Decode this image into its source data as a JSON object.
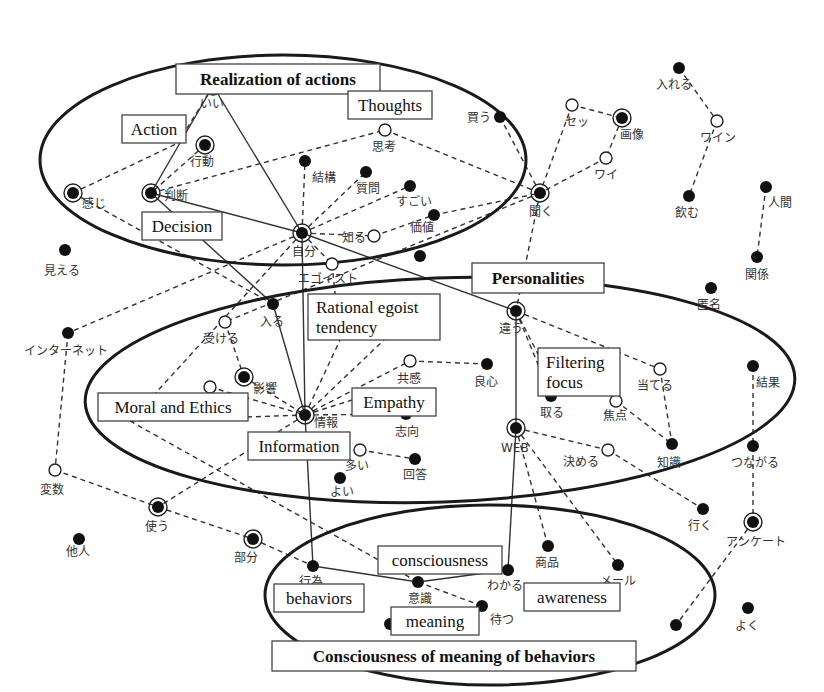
{
  "ellipses": [
    {
      "id": "realization",
      "cx": 283,
      "cy": 160,
      "rx": 243,
      "ry": 105,
      "rot": 0
    },
    {
      "id": "personalities",
      "cx": 440,
      "cy": 390,
      "rx": 355,
      "ry": 112,
      "rot": -2
    },
    {
      "id": "consciousness",
      "cx": 490,
      "cy": 595,
      "rx": 225,
      "ry": 90,
      "rot": 0
    }
  ],
  "categories": [
    {
      "id": "realization",
      "label": "Realization of actions",
      "x": 176,
      "y": 64,
      "w": 204,
      "h": 30,
      "bold": true
    },
    {
      "id": "action",
      "label": "Action",
      "x": 122,
      "y": 115,
      "w": 64,
      "h": 28,
      "bold": false
    },
    {
      "id": "thoughts",
      "label": "Thoughts",
      "x": 348,
      "y": 91,
      "w": 84,
      "h": 28,
      "bold": false
    },
    {
      "id": "decision",
      "label": "Decision",
      "x": 142,
      "y": 212,
      "w": 80,
      "h": 28,
      "bold": false
    },
    {
      "id": "personalities",
      "label": "Personalities",
      "x": 472,
      "y": 263,
      "w": 132,
      "h": 30,
      "bold": true
    },
    {
      "id": "rational",
      "label": "Rational egoist\ntendency",
      "x": 308,
      "y": 294,
      "w": 132,
      "h": 46,
      "bold": false
    },
    {
      "id": "filtering",
      "label": "Filtering\nfocus",
      "x": 538,
      "y": 348,
      "w": 82,
      "h": 48,
      "bold": false
    },
    {
      "id": "moral",
      "label": "Moral and Ethics",
      "x": 98,
      "y": 393,
      "w": 150,
      "h": 28,
      "bold": false
    },
    {
      "id": "empathy",
      "label": "Empathy",
      "x": 352,
      "y": 388,
      "w": 84,
      "h": 28,
      "bold": false
    },
    {
      "id": "information",
      "label": "Information",
      "x": 248,
      "y": 432,
      "w": 102,
      "h": 28,
      "bold": false
    },
    {
      "id": "consciousness",
      "label": "consciousness",
      "x": 378,
      "y": 546,
      "w": 124,
      "h": 28,
      "bold": false
    },
    {
      "id": "behaviors",
      "label": "behaviors",
      "x": 274,
      "y": 584,
      "w": 90,
      "h": 28,
      "bold": false
    },
    {
      "id": "awareness",
      "label": "awareness",
      "x": 524,
      "y": 583,
      "w": 96,
      "h": 28,
      "bold": false
    },
    {
      "id": "meaning",
      "label": "meaning",
      "x": 391,
      "y": 607,
      "w": 88,
      "h": 28,
      "bold": false
    },
    {
      "id": "cmb",
      "label": "Consciousness of meaning of behaviors",
      "x": 272,
      "y": 641,
      "w": 364,
      "h": 30,
      "bold": true
    }
  ],
  "nodes": [
    {
      "id": "ii",
      "label": "いい",
      "x": 213,
      "y": 86,
      "type": "ring",
      "lx": 200,
      "ly": 108
    },
    {
      "id": "koudou",
      "label": "行動",
      "x": 205,
      "y": 145,
      "type": "ring",
      "lx": 190,
      "ly": 166
    },
    {
      "id": "kanji",
      "label": "感じ",
      "x": 73,
      "y": 193,
      "type": "ring",
      "lx": 82,
      "ly": 208
    },
    {
      "id": "handan",
      "label": "判断",
      "x": 151,
      "y": 193,
      "type": "ring",
      "lx": 164,
      "ly": 200
    },
    {
      "id": "kekkou",
      "label": "結構",
      "x": 305,
      "y": 161,
      "type": "filled",
      "lx": 312,
      "ly": 182
    },
    {
      "id": "shitsumon",
      "label": "質問",
      "x": 366,
      "y": 172,
      "type": "filled",
      "lx": 356,
      "ly": 193
    },
    {
      "id": "sugoi",
      "label": "すごい",
      "x": 410,
      "y": 186,
      "type": "filled",
      "lx": 396,
      "ly": 206
    },
    {
      "id": "shikou",
      "label": "思考",
      "x": 385,
      "y": 130,
      "type": "open",
      "lx": 372,
      "ly": 151
    },
    {
      "id": "kachi",
      "label": "価値",
      "x": 434,
      "y": 215,
      "type": "filled",
      "lx": 410,
      "ly": 232
    },
    {
      "id": "shiru",
      "label": "知る",
      "x": 374,
      "y": 236,
      "type": "open",
      "lx": 342,
      "ly": 242
    },
    {
      "id": "jibun",
      "label": "自分",
      "x": 302,
      "y": 233,
      "type": "ring",
      "lx": 292,
      "ly": 256
    },
    {
      "id": "egoist",
      "label": "エゴイスト",
      "x": 332,
      "y": 264,
      "type": "open",
      "lx": 298,
      "ly": 283
    },
    {
      "id": "kau",
      "label": "買う",
      "x": 500,
      "y": 117,
      "type": "filled",
      "lx": 467,
      "ly": 122
    },
    {
      "id": "setsu",
      "label": "セッ",
      "x": 572,
      "y": 105,
      "type": "open",
      "lx": 565,
      "ly": 126
    },
    {
      "id": "gazou",
      "label": "画像",
      "x": 622,
      "y": 118,
      "type": "ring",
      "lx": 620,
      "ly": 139
    },
    {
      "id": "wai",
      "label": "ワイ",
      "x": 606,
      "y": 158,
      "type": "open",
      "lx": 594,
      "ly": 179
    },
    {
      "id": "kiku",
      "label": "聞く",
      "x": 540,
      "y": 193,
      "type": "ring",
      "lx": 529,
      "ly": 216
    },
    {
      "id": "ireru",
      "label": "入れる",
      "x": 679,
      "y": 68,
      "type": "filled",
      "lx": 656,
      "ly": 89
    },
    {
      "id": "wain",
      "label": "ワイン",
      "x": 717,
      "y": 121,
      "type": "open",
      "lx": 700,
      "ly": 142
    },
    {
      "id": "nomu",
      "label": "飲む",
      "x": 689,
      "y": 196,
      "type": "filled",
      "lx": 675,
      "ly": 217
    },
    {
      "id": "ningen",
      "label": "人間",
      "x": 766,
      "y": 187,
      "type": "filled",
      "lx": 768,
      "ly": 207
    },
    {
      "id": "kankei",
      "label": "関係",
      "x": 757,
      "y": 257,
      "type": "filled",
      "lx": 745,
      "ly": 279
    },
    {
      "id": "tokumei",
      "label": "匿名",
      "x": 711,
      "y": 288,
      "type": "filled",
      "lx": 697,
      "ly": 309
    },
    {
      "id": "mieru",
      "label": "見える",
      "x": 65,
      "y": 250,
      "type": "filled",
      "lx": 44,
      "ly": 275
    },
    {
      "id": "hairu",
      "label": "入る",
      "x": 273,
      "y": 304,
      "type": "filled",
      "lx": 260,
      "ly": 326
    },
    {
      "id": "internet",
      "label": "インターネット",
      "x": 68,
      "y": 333,
      "type": "filled",
      "lx": 24,
      "ly": 355
    },
    {
      "id": "ukeru",
      "label": "受ける",
      "x": 225,
      "y": 322,
      "type": "open",
      "lx": 203,
      "ly": 343
    },
    {
      "id": "eikyou",
      "label": "影響",
      "x": 244,
      "y": 377,
      "type": "ring",
      "lx": 253,
      "ly": 393
    },
    {
      "id": "moral_open",
      "label": "",
      "x": 210,
      "y": 387,
      "type": "open",
      "lx": 0,
      "ly": 0
    },
    {
      "id": "jouhou",
      "label": "情報",
      "x": 305,
      "y": 415,
      "type": "ring",
      "lx": 314,
      "ly": 427
    },
    {
      "id": "kyoukan",
      "label": "共感",
      "x": 410,
      "y": 361,
      "type": "open",
      "lx": 397,
      "ly": 383
    },
    {
      "id": "ryoushin",
      "label": "良心",
      "x": 487,
      "y": 364,
      "type": "filled",
      "lx": 474,
      "ly": 386
    },
    {
      "id": "shikou2",
      "label": "志向",
      "x": 406,
      "y": 414,
      "type": "filled",
      "lx": 395,
      "ly": 436
    },
    {
      "id": "ooi",
      "label": "多い",
      "x": 360,
      "y": 450,
      "type": "open",
      "lx": 345,
      "ly": 470
    },
    {
      "id": "kaitou",
      "label": "回答",
      "x": 415,
      "y": 459,
      "type": "filled",
      "lx": 403,
      "ly": 479
    },
    {
      "id": "yoi",
      "label": "よい",
      "x": 340,
      "y": 478,
      "type": "filled",
      "lx": 330,
      "ly": 496
    },
    {
      "id": "chigau",
      "label": "違う",
      "x": 516,
      "y": 311,
      "type": "ring",
      "lx": 499,
      "ly": 333
    },
    {
      "id": "ateru",
      "label": "当てる",
      "x": 660,
      "y": 369,
      "type": "open",
      "lx": 637,
      "ly": 390
    },
    {
      "id": "toru",
      "label": "取る",
      "x": 551,
      "y": 396,
      "type": "filled",
      "lx": 540,
      "ly": 417
    },
    {
      "id": "shouten",
      "label": "焦点",
      "x": 616,
      "y": 401,
      "type": "open",
      "lx": 603,
      "ly": 420
    },
    {
      "id": "chishiki",
      "label": "知識",
      "x": 672,
      "y": 444,
      "type": "filled",
      "lx": 657,
      "ly": 467
    },
    {
      "id": "web",
      "label": "WEB",
      "x": 516,
      "y": 428,
      "type": "ring",
      "lx": 501,
      "ly": 452
    },
    {
      "id": "kimeru",
      "label": "決める",
      "x": 608,
      "y": 450,
      "type": "open",
      "lx": 563,
      "ly": 466
    },
    {
      "id": "kekka",
      "label": "結果",
      "x": 753,
      "y": 366,
      "type": "filled",
      "lx": 756,
      "ly": 387
    },
    {
      "id": "tsunagaru",
      "label": "つながる",
      "x": 753,
      "y": 446,
      "type": "filled",
      "lx": 731,
      "ly": 467
    },
    {
      "id": "hensuu",
      "label": "変数",
      "x": 55,
      "y": 470,
      "type": "open",
      "lx": 40,
      "ly": 494
    },
    {
      "id": "tsukau",
      "label": "使う",
      "x": 158,
      "y": 507,
      "type": "ring",
      "lx": 145,
      "ly": 531
    },
    {
      "id": "tanin",
      "label": "他人",
      "x": 79,
      "y": 539,
      "type": "filled",
      "lx": 66,
      "ly": 556
    },
    {
      "id": "bubun",
      "label": "部分",
      "x": 253,
      "y": 539,
      "type": "ring",
      "lx": 234,
      "ly": 562
    },
    {
      "id": "iku",
      "label": "行く",
      "x": 703,
      "y": 509,
      "type": "filled",
      "lx": 688,
      "ly": 530
    },
    {
      "id": "enquete",
      "label": "アンケート",
      "x": 753,
      "y": 522,
      "type": "ring",
      "lx": 726,
      "ly": 546
    },
    {
      "id": "shouhin",
      "label": "商品",
      "x": 548,
      "y": 546,
      "type": "filled",
      "lx": 535,
      "ly": 567
    },
    {
      "id": "meeru",
      "label": "メール",
      "x": 618,
      "y": 565,
      "type": "filled",
      "lx": 600,
      "ly": 585
    },
    {
      "id": "koui",
      "label": "行為",
      "x": 313,
      "y": 566,
      "type": "filled",
      "lx": 299,
      "ly": 586
    },
    {
      "id": "wakaru",
      "label": "わかる",
      "x": 508,
      "y": 570,
      "type": "filled",
      "lx": 487,
      "ly": 590
    },
    {
      "id": "ishiki",
      "label": "意識",
      "x": 418,
      "y": 582,
      "type": "filled",
      "lx": 408,
      "ly": 603
    },
    {
      "id": "matsu",
      "label": "待つ",
      "x": 482,
      "y": 606,
      "type": "filled",
      "lx": 490,
      "ly": 624
    },
    {
      "id": "meaning_dot",
      "label": "",
      "x": 390,
      "y": 624,
      "type": "filled",
      "lx": 0,
      "ly": 0
    },
    {
      "id": "bottom_dot",
      "label": "",
      "x": 676,
      "y": 625,
      "type": "filled",
      "lx": 0,
      "ly": 0
    },
    {
      "id": "yoku",
      "label": "よく",
      "x": 748,
      "y": 608,
      "type": "filled",
      "lx": 735,
      "ly": 630
    },
    {
      "id": "dot_kachi2",
      "label": "",
      "x": 420,
      "y": 256,
      "type": "filled",
      "lx": 0,
      "ly": 0
    }
  ],
  "edges": [
    {
      "a": "ii",
      "b": "handan",
      "style": "solid"
    },
    {
      "a": "ii",
      "b": "jibun",
      "style": "solid"
    },
    {
      "a": "handan",
      "b": "jibun",
      "style": "solid"
    },
    {
      "a": "handan",
      "b": "hairu",
      "style": "solid"
    },
    {
      "a": "hairu",
      "b": "jouhou",
      "style": "solid"
    },
    {
      "a": "jibun",
      "b": "jouhou",
      "style": "solid"
    },
    {
      "a": "jibun",
      "b": "chigau",
      "style": "solid"
    },
    {
      "a": "chigau",
      "b": "web",
      "style": "solid"
    },
    {
      "a": "jouhou",
      "b": "koui",
      "style": "solid"
    },
    {
      "a": "koui",
      "b": "ishiki",
      "style": "solid"
    },
    {
      "a": "ishiki",
      "b": "wakaru",
      "style": "solid"
    },
    {
      "a": "web",
      "b": "wakaru",
      "style": "solid"
    },
    {
      "a": "ii",
      "b": "action_box",
      "style": "dash"
    },
    {
      "a": "kanji",
      "b": "action_box",
      "style": "dash"
    },
    {
      "a": "koudou",
      "b": "handan",
      "style": "dash"
    },
    {
      "a": "handan",
      "b": "shikou",
      "style": "dash"
    },
    {
      "a": "shikou",
      "b": "kiku",
      "style": "dash"
    },
    {
      "a": "jibun",
      "b": "kekkou",
      "style": "dash"
    },
    {
      "a": "jibun",
      "b": "shitsumon",
      "style": "dash"
    },
    {
      "a": "jibun",
      "b": "sugoi",
      "style": "dash"
    },
    {
      "a": "jibun",
      "b": "shiru",
      "style": "dash"
    },
    {
      "a": "shiru",
      "b": "kachi",
      "style": "dash"
    },
    {
      "a": "kachi",
      "b": "kiku",
      "style": "dash"
    },
    {
      "a": "kau",
      "b": "kiku",
      "style": "dash"
    },
    {
      "a": "setsu",
      "b": "kiku",
      "style": "dash"
    },
    {
      "a": "setsu",
      "b": "gazou",
      "style": "dash"
    },
    {
      "a": "gazou",
      "b": "wai",
      "style": "dash"
    },
    {
      "a": "wai",
      "b": "kiku",
      "style": "dash"
    },
    {
      "a": "kiku",
      "b": "chigau",
      "style": "dash"
    },
    {
      "a": "kiku",
      "b": "ukeru",
      "style": "dash"
    },
    {
      "a": "ireru",
      "b": "wain",
      "style": "dash"
    },
    {
      "a": "wain",
      "b": "nomu",
      "style": "dash"
    },
    {
      "a": "ningen",
      "b": "kankei",
      "style": "dash"
    },
    {
      "a": "kanji",
      "b": "hairu",
      "style": "dash"
    },
    {
      "a": "jibun",
      "b": "internet",
      "style": "dash"
    },
    {
      "a": "jibun",
      "b": "moral_box",
      "style": "dash"
    },
    {
      "a": "jibun",
      "b": "egoist",
      "style": "dash"
    },
    {
      "a": "egoist",
      "b": "rational_box",
      "style": "dash"
    },
    {
      "a": "internet",
      "b": "hensuu",
      "style": "dash"
    },
    {
      "a": "ukeru",
      "b": "eikyou",
      "style": "dash"
    },
    {
      "a": "eikyou",
      "b": "jouhou",
      "style": "dash"
    },
    {
      "a": "moral_open",
      "b": "jouhou",
      "style": "dash"
    },
    {
      "a": "moral_box",
      "b": "jouhou",
      "style": "dash"
    },
    {
      "a": "jouhou",
      "b": "rational_box",
      "style": "dash"
    },
    {
      "a": "jouhou",
      "b": "rational_box2",
      "style": "dash"
    },
    {
      "a": "jouhou",
      "b": "kyoukan",
      "style": "dash"
    },
    {
      "a": "jouhou",
      "b": "empathy_box",
      "style": "dash"
    },
    {
      "a": "jouhou",
      "b": "shikou2",
      "style": "dash"
    },
    {
      "a": "jouhou",
      "b": "tsukau",
      "style": "dash"
    },
    {
      "a": "kyoukan",
      "b": "ryoushin",
      "style": "dash"
    },
    {
      "a": "ooi",
      "b": "kaitou",
      "style": "dash"
    },
    {
      "a": "moral_box",
      "b": "ishiki",
      "style": "dash"
    },
    {
      "a": "hensuu",
      "b": "tsukau",
      "style": "dash"
    },
    {
      "a": "tsukau",
      "b": "bubun",
      "style": "dash"
    },
    {
      "a": "bubun",
      "b": "koui",
      "style": "dash"
    },
    {
      "a": "ishiki",
      "b": "matsu",
      "style": "dash"
    },
    {
      "a": "chigau",
      "b": "ateru",
      "style": "dash"
    },
    {
      "a": "chigau",
      "b": "toru",
      "style": "dash"
    },
    {
      "a": "chigau",
      "b": "filtering_box",
      "style": "dash"
    },
    {
      "a": "ateru",
      "b": "chishiki",
      "style": "dash"
    },
    {
      "a": "shouten",
      "b": "chishiki",
      "style": "dash"
    },
    {
      "a": "web",
      "b": "kimeru",
      "style": "dash"
    },
    {
      "a": "kimeru",
      "b": "iku",
      "style": "dash"
    },
    {
      "a": "web",
      "b": "shouhin",
      "style": "dash"
    },
    {
      "a": "web",
      "b": "meeru",
      "style": "dash"
    },
    {
      "a": "kekka",
      "b": "tsunagaru",
      "style": "dash"
    },
    {
      "a": "tsunagaru",
      "b": "enquete",
      "style": "dash"
    },
    {
      "a": "enquete",
      "b": "bottom_dot",
      "style": "dash"
    }
  ],
  "anchors": {
    "action_box": {
      "x": 178,
      "y": 143
    },
    "moral_box": {
      "x": 130,
      "y": 421
    },
    "rational_box": {
      "x": 340,
      "y": 340
    },
    "rational_box2": {
      "x": 384,
      "y": 340
    },
    "empathy_box": {
      "x": 352,
      "y": 400
    },
    "filtering_box": {
      "x": 540,
      "y": 358
    }
  },
  "colors": {
    "ink": "#111111",
    "background": "#ffffff",
    "box_border": "#444444"
  }
}
